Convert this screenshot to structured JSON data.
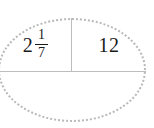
{
  "figure": {
    "type": "half-ellipse-two-cell-table",
    "shape": "ellipse",
    "outline_style": "dotted",
    "outline_color": "#b9b9b9",
    "line_color": "#bdbdbd",
    "text_color": "#1a1a1a",
    "background": "#ffffff"
  },
  "cells": {
    "left": {
      "kind": "mixed-number",
      "whole": "2",
      "numerator": "1",
      "denominator": "7",
      "plain": "2 1/7"
    },
    "right": {
      "kind": "integer",
      "value": "12"
    }
  }
}
